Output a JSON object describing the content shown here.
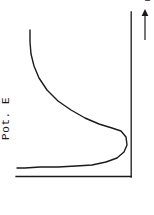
{
  "figure": {
    "orientation": "rotated-90",
    "background_color": "#ffffff",
    "ink_color": "#1a1a1a"
  },
  "labels": {
    "y_axis": "Pot. E",
    "x_axis": "r"
  },
  "chart_data": {
    "type": "line",
    "title": "",
    "xlabel": "r",
    "ylabel": "Pot. E",
    "subtitle": "",
    "grid": false,
    "legend": null,
    "annotations": [
      {
        "name": "axis-direction-arrow",
        "text": "r",
        "direction": "up",
        "x": 148,
        "y": 30
      }
    ],
    "axes": {
      "note": "Figure is rotated 90 degrees; the drawn horizontal rule and the drawn vertical rule form the plot frame.",
      "horizontal_rule": {
        "x_start": 16,
        "x_end": 131,
        "y": 176
      },
      "vertical_rule": {
        "x": 131,
        "y_start": 12,
        "y_end": 177
      },
      "xlim": [
        0,
        154
      ],
      "ylim": [
        0,
        215
      ]
    },
    "series": [
      {
        "name": "potential-energy-curve",
        "color": "#1a1a1a",
        "linewidth": 1.4,
        "points": [
          [
            30,
            30
          ],
          [
            30,
            42
          ],
          [
            31,
            54
          ],
          [
            34,
            66
          ],
          [
            39,
            78
          ],
          [
            47,
            90
          ],
          [
            58,
            101
          ],
          [
            71,
            110
          ],
          [
            85,
            118
          ],
          [
            99,
            124
          ],
          [
            112,
            128
          ],
          [
            121,
            131
          ],
          [
            126,
            137
          ],
          [
            127,
            145
          ],
          [
            124,
            152
          ],
          [
            117,
            158
          ],
          [
            106,
            162
          ],
          [
            92,
            165
          ],
          [
            76,
            166
          ],
          [
            58,
            167
          ],
          [
            40,
            167
          ],
          [
            25,
            168
          ],
          [
            17,
            168
          ]
        ]
      }
    ]
  }
}
